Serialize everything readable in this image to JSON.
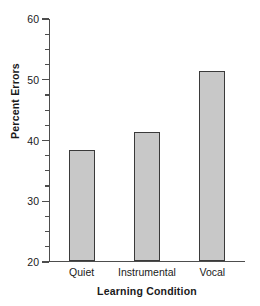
{
  "chart_data": {
    "type": "bar",
    "title": "",
    "xlabel": "Learning Condition",
    "ylabel": "Percent Errors",
    "categories": [
      "Quiet",
      "Instrumental",
      "Vocal"
    ],
    "values": [
      38.4,
      41.4,
      51.4
    ],
    "ylim": [
      20,
      60
    ],
    "ytick_labels": [
      "20",
      "30",
      "40",
      "50",
      "60"
    ],
    "ytick_values": [
      20,
      30,
      40,
      50,
      60
    ],
    "yminor_step": 2.5,
    "grid": false,
    "legend": false,
    "bar_fill_color": "#c8c8c8",
    "bar_edge_color": "#3a3a3a",
    "axis_color": "#4d4d4d",
    "background_color": "#ffffff"
  },
  "axes": {
    "y_title": "Percent Errors",
    "x_title": "Learning Condition"
  }
}
